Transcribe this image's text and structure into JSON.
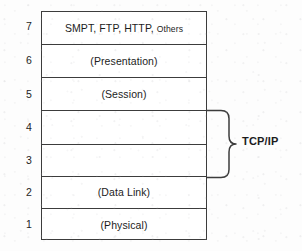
{
  "diagram": {
    "ink_color": "#3c3c3c",
    "text_color": "#1c1c1c",
    "background_color": "#fdfdfd",
    "layers": [
      {
        "number": "7",
        "label": "SMPT, FTP, HTTP,",
        "label_small": "Others"
      },
      {
        "number": "6",
        "label": "(Presentation)",
        "label_small": ""
      },
      {
        "number": "5",
        "label": "(Session)",
        "label_small": ""
      },
      {
        "number": "4",
        "label": "",
        "label_small": ""
      },
      {
        "number": "3",
        "label": "",
        "label_small": ""
      },
      {
        "number": "2",
        "label": "(Data Link)",
        "label_small": ""
      },
      {
        "number": "1",
        "label": "(Physical)",
        "label_small": ""
      }
    ],
    "brace": {
      "label": "TCP/IP",
      "spans_layers": "4 and 3"
    }
  }
}
